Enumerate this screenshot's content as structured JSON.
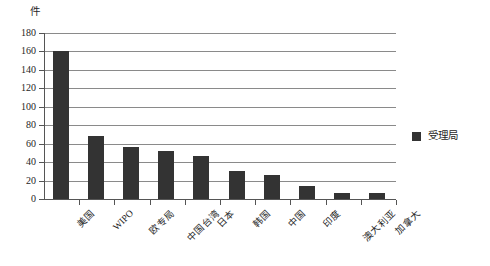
{
  "chart_data": {
    "type": "bar",
    "title": "",
    "xlabel": "",
    "ylabel": "件",
    "ylim": [
      0,
      180
    ],
    "ytick_step": 20,
    "yticks": [
      0,
      20,
      40,
      60,
      80,
      100,
      120,
      140,
      160,
      180
    ],
    "grid": true,
    "legend_position": "right",
    "categories": [
      "美国",
      "WIPO",
      "欧专局",
      "中国台湾",
      "日本",
      "韩国",
      "中国",
      "印度",
      "澳大利亚",
      "加拿大"
    ],
    "series": [
      {
        "name": "受理局",
        "color": "#333333",
        "values": [
          161,
          68,
          56,
          52,
          47,
          30,
          26,
          14,
          7,
          6
        ]
      }
    ]
  },
  "legend": {
    "entries": [
      {
        "label": "受理局",
        "color": "#333333"
      }
    ]
  },
  "axes": {
    "y_unit_caption": "件"
  },
  "colors": {
    "bar": "#333333",
    "gridline": "#8a8a8a",
    "axis": "#555555",
    "text": "#262626",
    "background": "#ffffff"
  }
}
